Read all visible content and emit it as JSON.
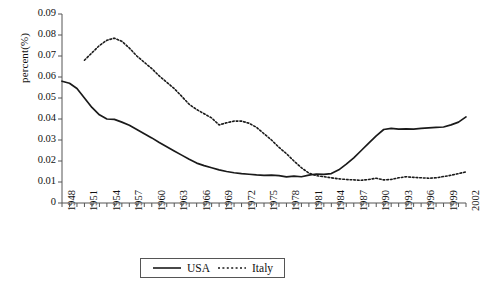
{
  "chart_data": {
    "type": "line",
    "title": "",
    "xlabel": "",
    "ylabel": "percent(%)",
    "xlim": [
      1948,
      2002
    ],
    "ylim": [
      0,
      0.09
    ],
    "grid": false,
    "legend_position": "bottom-center",
    "ytick_labels": [
      "0.09",
      "0.08",
      "0.07",
      "0.06",
      "0.05",
      "0.04",
      "0.03",
      "0.02",
      "0.01",
      "0"
    ],
    "ytick_values": [
      0.09,
      0.08,
      0.07,
      0.06,
      0.05,
      0.04,
      0.03,
      0.02,
      0.01,
      0
    ],
    "xtick_labels": [
      "1948",
      "1951",
      "1954",
      "1957",
      "1960",
      "1963",
      "1966",
      "1969",
      "1972",
      "1975",
      "1978",
      "1981",
      "1984",
      "1987",
      "1990",
      "1993",
      "1996",
      "1999",
      "2002"
    ],
    "xtick_values": [
      1948,
      1951,
      1954,
      1957,
      1960,
      1963,
      1966,
      1969,
      1972,
      1975,
      1978,
      1981,
      1984,
      1987,
      1990,
      1993,
      1996,
      1999,
      2002
    ],
    "x": [
      1948,
      1949,
      1950,
      1951,
      1952,
      1953,
      1954,
      1955,
      1956,
      1957,
      1958,
      1959,
      1960,
      1961,
      1962,
      1963,
      1964,
      1965,
      1966,
      1967,
      1968,
      1969,
      1970,
      1971,
      1972,
      1973,
      1974,
      1975,
      1976,
      1977,
      1978,
      1979,
      1980,
      1981,
      1982,
      1983,
      1984,
      1985,
      1986,
      1987,
      1988,
      1989,
      1990,
      1991,
      1992,
      1993,
      1994,
      1995,
      1996,
      1997,
      1998,
      1999,
      2000,
      2001,
      2002
    ],
    "series": [
      {
        "name": "USA",
        "style": "solid",
        "color": "#1a1a1a",
        "values": [
          0.058,
          0.057,
          0.0545,
          0.05,
          0.0455,
          0.042,
          0.04,
          0.0398,
          0.0385,
          0.037,
          0.035,
          0.033,
          0.031,
          0.0288,
          0.0268,
          0.0248,
          0.0228,
          0.0208,
          0.019,
          0.0178,
          0.0168,
          0.0158,
          0.015,
          0.0144,
          0.014,
          0.0137,
          0.0134,
          0.0132,
          0.0133,
          0.013,
          0.0124,
          0.0128,
          0.0125,
          0.0133,
          0.0138,
          0.0136,
          0.014,
          0.0158,
          0.0185,
          0.0215,
          0.025,
          0.0285,
          0.032,
          0.035,
          0.0355,
          0.0352,
          0.0353,
          0.0352,
          0.0355,
          0.0358,
          0.036,
          0.0362,
          0.0372,
          0.0385,
          0.041
        ]
      },
      {
        "name": "Italy",
        "style": "dotted",
        "color": "#1a1a1a",
        "values": [
          null,
          null,
          null,
          0.068,
          0.0715,
          0.075,
          0.0775,
          0.0785,
          0.077,
          0.0738,
          0.07,
          0.067,
          0.064,
          0.0605,
          0.0575,
          0.0545,
          0.0508,
          0.047,
          0.0445,
          0.0425,
          0.0405,
          0.0372,
          0.0382,
          0.039,
          0.039,
          0.038,
          0.036,
          0.033,
          0.03,
          0.0265,
          0.0235,
          0.02,
          0.0168,
          0.0142,
          0.013,
          0.0125,
          0.012,
          0.0115,
          0.0112,
          0.011,
          0.0108,
          0.0112,
          0.0118,
          0.011,
          0.0112,
          0.012,
          0.0125,
          0.0122,
          0.012,
          0.0118,
          0.012,
          0.0126,
          0.0132,
          0.014,
          0.0148
        ]
      }
    ]
  },
  "legend": {
    "items": [
      {
        "label": "USA",
        "style": "solid"
      },
      {
        "label": "Italy",
        "style": "dotted"
      }
    ]
  }
}
